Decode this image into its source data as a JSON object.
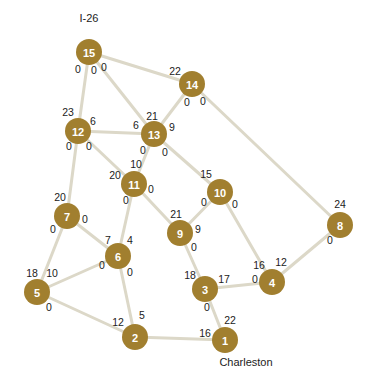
{
  "diagram": {
    "type": "network-graph",
    "node_color": "#a17f2f",
    "edge_color": "#dcd8c8",
    "place_labels": [
      {
        "text": "I-26",
        "x": 89,
        "y": 18
      },
      {
        "text": "Charleston",
        "x": 246,
        "y": 362
      }
    ],
    "nodes": [
      {
        "id": "15",
        "x": 89,
        "y": 52
      },
      {
        "id": "14",
        "x": 192,
        "y": 84
      },
      {
        "id": "12",
        "x": 78,
        "y": 131
      },
      {
        "id": "13",
        "x": 154,
        "y": 134
      },
      {
        "id": "11",
        "x": 134,
        "y": 184
      },
      {
        "id": "10",
        "x": 220,
        "y": 192
      },
      {
        "id": "7",
        "x": 67,
        "y": 216
      },
      {
        "id": "8",
        "x": 340,
        "y": 225
      },
      {
        "id": "9",
        "x": 180,
        "y": 233
      },
      {
        "id": "6",
        "x": 118,
        "y": 256
      },
      {
        "id": "5",
        "x": 37,
        "y": 292
      },
      {
        "id": "3",
        "x": 205,
        "y": 289
      },
      {
        "id": "4",
        "x": 272,
        "y": 282
      },
      {
        "id": "2",
        "x": 135,
        "y": 337
      },
      {
        "id": "1",
        "x": 225,
        "y": 340
      }
    ],
    "edges": [
      {
        "from": "15",
        "to": "12"
      },
      {
        "from": "15",
        "to": "13"
      },
      {
        "from": "15",
        "to": "14"
      },
      {
        "from": "14",
        "to": "13"
      },
      {
        "from": "14",
        "to": "8"
      },
      {
        "from": "12",
        "to": "13"
      },
      {
        "from": "12",
        "to": "7"
      },
      {
        "from": "12",
        "to": "11"
      },
      {
        "from": "13",
        "to": "11"
      },
      {
        "from": "13",
        "to": "10"
      },
      {
        "from": "11",
        "to": "6"
      },
      {
        "from": "11",
        "to": "9"
      },
      {
        "from": "10",
        "to": "9"
      },
      {
        "from": "10",
        "to": "4"
      },
      {
        "from": "7",
        "to": "5"
      },
      {
        "from": "7",
        "to": "6"
      },
      {
        "from": "6",
        "to": "5"
      },
      {
        "from": "6",
        "to": "2"
      },
      {
        "from": "5",
        "to": "2"
      },
      {
        "from": "9",
        "to": "3"
      },
      {
        "from": "3",
        "to": "4"
      },
      {
        "from": "3",
        "to": "1"
      },
      {
        "from": "2",
        "to": "1"
      },
      {
        "from": "8",
        "to": "4"
      }
    ],
    "numbers": [
      {
        "text": "0",
        "x": 78,
        "y": 69
      },
      {
        "text": "0",
        "x": 94,
        "y": 70
      },
      {
        "text": "0",
        "x": 104,
        "y": 67
      },
      {
        "text": "22",
        "x": 175,
        "y": 71
      },
      {
        "text": "0",
        "x": 187,
        "y": 102
      },
      {
        "text": "0",
        "x": 203,
        "y": 101
      },
      {
        "text": "23",
        "x": 68,
        "y": 112
      },
      {
        "text": "6",
        "x": 93,
        "y": 121
      },
      {
        "text": "6",
        "x": 136,
        "y": 125
      },
      {
        "text": "21",
        "x": 152,
        "y": 116
      },
      {
        "text": "9",
        "x": 172,
        "y": 127
      },
      {
        "text": "0",
        "x": 69,
        "y": 146
      },
      {
        "text": "0",
        "x": 89,
        "y": 146
      },
      {
        "text": "0",
        "x": 143,
        "y": 150
      },
      {
        "text": "0",
        "x": 165,
        "y": 152
      },
      {
        "text": "10",
        "x": 136,
        "y": 164
      },
      {
        "text": "20",
        "x": 115,
        "y": 175
      },
      {
        "text": "0",
        "x": 151,
        "y": 189
      },
      {
        "text": "15",
        "x": 206,
        "y": 174
      },
      {
        "text": "0",
        "x": 126,
        "y": 200
      },
      {
        "text": "0",
        "x": 204,
        "y": 202
      },
      {
        "text": "0",
        "x": 235,
        "y": 204
      },
      {
        "text": "20",
        "x": 60,
        "y": 197
      },
      {
        "text": "0",
        "x": 85,
        "y": 219
      },
      {
        "text": "24",
        "x": 340,
        "y": 204
      },
      {
        "text": "21",
        "x": 176,
        "y": 214
      },
      {
        "text": "9",
        "x": 198,
        "y": 229
      },
      {
        "text": "0",
        "x": 53,
        "y": 229
      },
      {
        "text": "0",
        "x": 330,
        "y": 240
      },
      {
        "text": "7",
        "x": 108,
        "y": 240
      },
      {
        "text": "4",
        "x": 130,
        "y": 240
      },
      {
        "text": "0",
        "x": 194,
        "y": 247
      },
      {
        "text": "0",
        "x": 102,
        "y": 265
      },
      {
        "text": "0",
        "x": 130,
        "y": 272
      },
      {
        "text": "16",
        "x": 259,
        "y": 265
      },
      {
        "text": "12",
        "x": 281,
        "y": 262
      },
      {
        "text": "18",
        "x": 32,
        "y": 273
      },
      {
        "text": "10",
        "x": 52,
        "y": 273
      },
      {
        "text": "18",
        "x": 190,
        "y": 275
      },
      {
        "text": "17",
        "x": 224,
        "y": 279
      },
      {
        "text": "0",
        "x": 255,
        "y": 279
      },
      {
        "text": "0",
        "x": 49,
        "y": 307
      },
      {
        "text": "0",
        "x": 207,
        "y": 307
      },
      {
        "text": "5",
        "x": 142,
        "y": 315
      },
      {
        "text": "12",
        "x": 118,
        "y": 322
      },
      {
        "text": "22",
        "x": 230,
        "y": 320
      },
      {
        "text": "16",
        "x": 205,
        "y": 333
      }
    ]
  }
}
